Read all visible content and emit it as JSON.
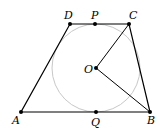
{
  "diagram": {
    "type": "geometry",
    "points": {
      "A": {
        "label": "A",
        "x": 21,
        "y": 112
      },
      "B": {
        "label": "B",
        "x": 150,
        "y": 112
      },
      "C": {
        "label": "C",
        "x": 129,
        "y": 24
      },
      "D": {
        "label": "D",
        "x": 70,
        "y": 24
      },
      "P": {
        "label": "P",
        "x": 95,
        "y": 24
      },
      "Q": {
        "label": "Q",
        "x": 96,
        "y": 112
      },
      "O": {
        "label": "O",
        "x": 96,
        "y": 68
      }
    },
    "circle": {
      "center": "O",
      "radius": 44,
      "color": "#c8c8c8"
    },
    "segments": [
      "AB",
      "BC",
      "CD",
      "DA",
      "OC",
      "OB"
    ],
    "colors": {
      "line": "#000000",
      "circle": "#c8c8c8"
    }
  }
}
